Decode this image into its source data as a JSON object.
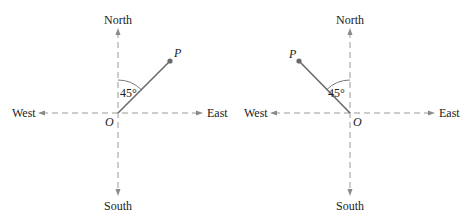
{
  "diagrams": [
    {
      "id": "left",
      "labels": {
        "north": "North",
        "south": "South",
        "east": "East",
        "west": "West",
        "origin": "O",
        "point": "P",
        "angle": "45°"
      },
      "origin": [
        118,
        113
      ],
      "point": [
        170,
        61
      ],
      "direction": "N45°E"
    },
    {
      "id": "right",
      "labels": {
        "north": "North",
        "south": "South",
        "east": "East",
        "west": "West",
        "origin": "O",
        "point": "P",
        "angle": "45°"
      },
      "origin": [
        350,
        113
      ],
      "point": [
        299,
        61
      ],
      "direction": "N45°W"
    }
  ],
  "colors": {
    "axis": "#9a9a9a",
    "ray": "#6a6a6a",
    "text": "#222222"
  }
}
